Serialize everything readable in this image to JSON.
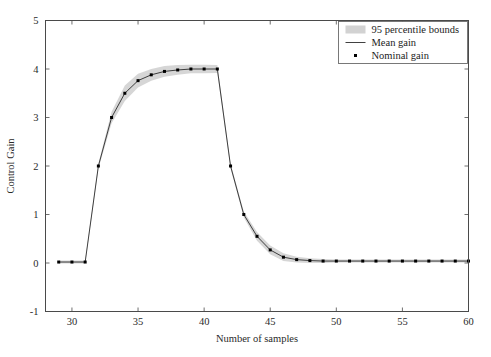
{
  "figure": {
    "background_color": "#ffffff",
    "axes_color": "#4a4a4a",
    "line_color": "#2b2b2b",
    "marker_color": "#000000",
    "band_color": "#d2d2d2"
  },
  "legend": {
    "position": "top-right",
    "border_color": "#6b6b6b",
    "entries": [
      {
        "label": "95 percentile bounds",
        "symbol": "patch"
      },
      {
        "label": "Mean gain",
        "symbol": "line"
      },
      {
        "label": "Nominal gain",
        "symbol": "dot"
      }
    ]
  },
  "chart_data": {
    "type": "line",
    "title": "",
    "xlabel": "Number of samples",
    "ylabel": "Control Gain",
    "xlim": [
      28,
      60
    ],
    "ylim": [
      -1,
      5
    ],
    "xticks": [
      30,
      35,
      40,
      45,
      50,
      55,
      60
    ],
    "yticks": [
      -1,
      0,
      1,
      2,
      3,
      4,
      5
    ],
    "xtick_labels": [
      "30",
      "35",
      "40",
      "45",
      "50",
      "55",
      "60"
    ],
    "ytick_labels": [
      "-1",
      "0",
      "1",
      "2",
      "3",
      "4",
      "5"
    ],
    "grid": false,
    "x": [
      29,
      30,
      31,
      32,
      33,
      34,
      35,
      36,
      37,
      38,
      39,
      40,
      41,
      42,
      43,
      44,
      45,
      46,
      47,
      48,
      49,
      50,
      51,
      52,
      53,
      54,
      55,
      56,
      57,
      58,
      59,
      60
    ],
    "series": [
      {
        "name": "Mean gain",
        "values": [
          0.02,
          0.02,
          0.02,
          2.0,
          3.0,
          3.5,
          3.76,
          3.88,
          3.95,
          3.98,
          4.0,
          4.0,
          4.0,
          2.0,
          1.0,
          0.55,
          0.27,
          0.12,
          0.07,
          0.05,
          0.04,
          0.04,
          0.04,
          0.04,
          0.04,
          0.04,
          0.04,
          0.04,
          0.04,
          0.04,
          0.04,
          0.04
        ]
      },
      {
        "name": "Nominal gain",
        "values": [
          0.02,
          0.02,
          0.02,
          2.0,
          3.0,
          3.5,
          3.76,
          3.88,
          3.95,
          3.98,
          4.0,
          4.0,
          4.0,
          2.0,
          1.0,
          0.55,
          0.27,
          0.12,
          0.07,
          0.05,
          0.04,
          0.04,
          0.04,
          0.04,
          0.04,
          0.04,
          0.04,
          0.04,
          0.04,
          0.04,
          0.04,
          0.04
        ]
      },
      {
        "name": "95 percentile upper bound",
        "values": [
          0.05,
          0.05,
          0.05,
          2.05,
          3.12,
          3.66,
          3.9,
          4.0,
          4.06,
          4.08,
          4.09,
          4.09,
          4.08,
          2.05,
          1.06,
          0.64,
          0.36,
          0.2,
          0.13,
          0.1,
          0.08,
          0.07,
          0.07,
          0.07,
          0.07,
          0.07,
          0.07,
          0.07,
          0.07,
          0.07,
          0.07,
          0.07
        ]
      },
      {
        "name": "95 percentile lower bound",
        "values": [
          -0.01,
          -0.01,
          -0.01,
          1.95,
          2.88,
          3.34,
          3.62,
          3.76,
          3.84,
          3.88,
          3.91,
          3.91,
          3.92,
          1.95,
          0.94,
          0.46,
          0.18,
          0.04,
          0.01,
          0.0,
          0.0,
          0.01,
          0.01,
          0.01,
          0.01,
          0.01,
          0.01,
          0.01,
          0.01,
          0.01,
          0.01,
          0.01
        ]
      }
    ]
  }
}
